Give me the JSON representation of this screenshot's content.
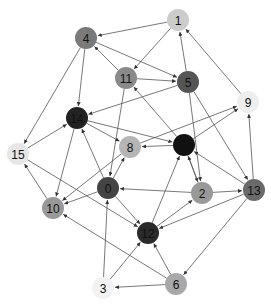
{
  "graph": {
    "type": "directed",
    "node_radius": 11,
    "nodes": [
      {
        "id": "0",
        "x": 108,
        "y": 188,
        "color": "#444444"
      },
      {
        "id": "1",
        "x": 178,
        "y": 20,
        "color": "#cccccc"
      },
      {
        "id": "2",
        "x": 202,
        "y": 193,
        "color": "#999999"
      },
      {
        "id": "3",
        "x": 103,
        "y": 288,
        "color": "#f2f2f2"
      },
      {
        "id": "4",
        "x": 86,
        "y": 38,
        "color": "#7a7a7a"
      },
      {
        "id": "5",
        "x": 188,
        "y": 82,
        "color": "#555555"
      },
      {
        "id": "6",
        "x": 176,
        "y": 284,
        "color": "#a8a8a8"
      },
      {
        "id": "7",
        "x": 184,
        "y": 145,
        "color": "#111111"
      },
      {
        "id": "8",
        "x": 130,
        "y": 147,
        "color": "#b5b5b5"
      },
      {
        "id": "9",
        "x": 248,
        "y": 102,
        "color": "#eeeeee"
      },
      {
        "id": "10",
        "x": 53,
        "y": 208,
        "color": "#999999"
      },
      {
        "id": "11",
        "x": 126,
        "y": 78,
        "color": "#8a8a8a"
      },
      {
        "id": "12",
        "x": 148,
        "y": 233,
        "color": "#2a2a2a"
      },
      {
        "id": "13",
        "x": 254,
        "y": 190,
        "color": "#6a6a6a"
      },
      {
        "id": "14",
        "x": 77,
        "y": 118,
        "color": "#222222"
      },
      {
        "id": "15",
        "x": 18,
        "y": 154,
        "color": "#e6e6e6"
      }
    ],
    "edges": [
      [
        "1",
        "4"
      ],
      [
        "1",
        "11"
      ],
      [
        "5",
        "1"
      ],
      [
        "9",
        "1"
      ],
      [
        "4",
        "14"
      ],
      [
        "4",
        "15"
      ],
      [
        "4",
        "5"
      ],
      [
        "11",
        "4"
      ],
      [
        "11",
        "5"
      ],
      [
        "5",
        "14"
      ],
      [
        "5",
        "2"
      ],
      [
        "5",
        "13"
      ],
      [
        "11",
        "0"
      ],
      [
        "14",
        "8"
      ],
      [
        "14",
        "7"
      ],
      [
        "15",
        "14"
      ],
      [
        "10",
        "15"
      ],
      [
        "14",
        "10"
      ],
      [
        "0",
        "14"
      ],
      [
        "7",
        "8"
      ],
      [
        "7",
        "11"
      ],
      [
        "7",
        "9"
      ],
      [
        "8",
        "9"
      ],
      [
        "7",
        "2"
      ],
      [
        "2",
        "7"
      ],
      [
        "0",
        "8"
      ],
      [
        "8",
        "10"
      ],
      [
        "0",
        "10"
      ],
      [
        "0",
        "12"
      ],
      [
        "2",
        "0"
      ],
      [
        "12",
        "7"
      ],
      [
        "12",
        "2"
      ],
      [
        "13",
        "12"
      ],
      [
        "13",
        "7"
      ],
      [
        "2",
        "13"
      ],
      [
        "13",
        "9"
      ],
      [
        "13",
        "6"
      ],
      [
        "6",
        "12"
      ],
      [
        "6",
        "3"
      ],
      [
        "3",
        "0"
      ],
      [
        "3",
        "12"
      ],
      [
        "6",
        "10"
      ],
      [
        "15",
        "12"
      ]
    ]
  }
}
